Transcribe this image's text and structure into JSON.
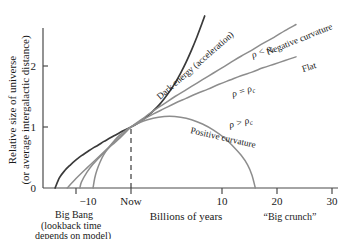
{
  "chart_data": {
    "type": "line",
    "title": "",
    "xlabel": "Billions of years",
    "ylabel": "Relative size of universe (or average intergalactic distance)",
    "ylabel_line1": "Relative size of universe",
    "ylabel_line2": "(or average intergalactic distance)",
    "xlim": [
      -14,
      30
    ],
    "ylim": [
      0,
      2.75
    ],
    "grid": false,
    "legend": "inline-curve-labels",
    "x_ticks": [
      {
        "value": -10,
        "label": "−10"
      },
      {
        "value": 0,
        "label": "Now"
      },
      {
        "value": 10,
        "label": "10"
      },
      {
        "value": 20,
        "label": "20"
      },
      {
        "value": 30,
        "label": "30"
      }
    ],
    "y_ticks": [
      {
        "value": 0,
        "label": "0"
      },
      {
        "value": 1,
        "label": "1"
      },
      {
        "value": 2,
        "label": "2"
      }
    ],
    "reference_lines": [
      {
        "name": "now-dashed-line",
        "x": 0,
        "y_from": 0,
        "y_to": 1,
        "style": "dashed"
      }
    ],
    "series": [
      {
        "name": "dark-energy",
        "label": "Dark energy (acceleration)",
        "color": "#3a3a3a",
        "width": 1.7,
        "big_bang_x": -13.8,
        "points": [
          [
            -13.8,
            0.0
          ],
          [
            -13.0,
            0.17
          ],
          [
            -12.0,
            0.29
          ],
          [
            -11.0,
            0.38
          ],
          [
            -10.0,
            0.46
          ],
          [
            -9.0,
            0.53
          ],
          [
            -8.0,
            0.59
          ],
          [
            -7.0,
            0.65
          ],
          [
            -6.0,
            0.7
          ],
          [
            -5.0,
            0.76
          ],
          [
            -4.0,
            0.81
          ],
          [
            -3.0,
            0.86
          ],
          [
            -2.0,
            0.91
          ],
          [
            -1.0,
            0.955
          ],
          [
            0.0,
            1.0
          ],
          [
            1.0,
            1.05
          ],
          [
            2.0,
            1.11
          ],
          [
            3.0,
            1.18
          ],
          [
            4.0,
            1.26
          ],
          [
            5.0,
            1.35
          ],
          [
            6.0,
            1.46
          ],
          [
            7.0,
            1.58
          ],
          [
            8.0,
            1.72
          ],
          [
            9.0,
            1.88
          ],
          [
            10.0,
            2.06
          ],
          [
            11.0,
            2.26
          ],
          [
            12.0,
            2.48
          ],
          [
            13.0,
            2.72
          ],
          [
            13.4,
            2.82
          ]
        ]
      },
      {
        "name": "negative-curvature",
        "label": "Negative curvature",
        "rho_label": "ρ < ρc",
        "color": "#8d8d8d",
        "width": 1.5,
        "big_bang_x": -11.6,
        "points": [
          [
            -11.6,
            0.0
          ],
          [
            -10.0,
            0.155
          ],
          [
            -8.0,
            0.33
          ],
          [
            -6.0,
            0.5
          ],
          [
            -4.0,
            0.67
          ],
          [
            -2.0,
            0.84
          ],
          [
            0.0,
            1.0
          ],
          [
            2.0,
            1.13
          ],
          [
            4.0,
            1.26
          ],
          [
            6.0,
            1.38
          ],
          [
            8.0,
            1.5
          ],
          [
            10.0,
            1.61
          ],
          [
            12.0,
            1.72
          ],
          [
            14.0,
            1.83
          ],
          [
            16.0,
            1.94
          ],
          [
            18.0,
            2.05
          ],
          [
            20.0,
            2.16
          ],
          [
            22.0,
            2.26
          ],
          [
            24.0,
            2.37
          ],
          [
            26.0,
            2.47
          ],
          [
            28.0,
            2.58
          ],
          [
            30.0,
            2.68
          ]
        ]
      },
      {
        "name": "flat",
        "label": "Flat",
        "rho_label": "ρ = ρc",
        "color": "#8d8d8d",
        "width": 1.5,
        "big_bang_x": -9.3,
        "points": [
          [
            -9.3,
            0.0
          ],
          [
            -9.0,
            0.1
          ],
          [
            -8.0,
            0.26
          ],
          [
            -7.0,
            0.38
          ],
          [
            -6.0,
            0.48
          ],
          [
            -5.0,
            0.57
          ],
          [
            -4.0,
            0.66
          ],
          [
            -3.0,
            0.74
          ],
          [
            -2.0,
            0.82
          ],
          [
            -1.0,
            0.91
          ],
          [
            0.0,
            1.0
          ],
          [
            2.0,
            1.11
          ],
          [
            4.0,
            1.21
          ],
          [
            6.0,
            1.3
          ],
          [
            8.0,
            1.39
          ],
          [
            10.0,
            1.47
          ],
          [
            12.0,
            1.55
          ],
          [
            14.0,
            1.62
          ],
          [
            16.0,
            1.7
          ],
          [
            18.0,
            1.77
          ],
          [
            20.0,
            1.84
          ],
          [
            22.0,
            1.9
          ],
          [
            24.0,
            1.97
          ],
          [
            26.0,
            2.03
          ],
          [
            28.0,
            2.09
          ],
          [
            30.0,
            2.15
          ]
        ]
      },
      {
        "name": "positive-curvature",
        "label": "Positive curvature",
        "rho_label": "ρ > ρc",
        "color": "#8d8d8d",
        "width": 1.5,
        "big_bang_x": -6.9,
        "big_crunch_x": 22.6,
        "points": [
          [
            -6.9,
            0.0
          ],
          [
            -6.6,
            0.16
          ],
          [
            -6.2,
            0.29
          ],
          [
            -5.6,
            0.43
          ],
          [
            -5.0,
            0.54
          ],
          [
            -4.0,
            0.67
          ],
          [
            -3.0,
            0.78
          ],
          [
            -2.0,
            0.87
          ],
          [
            -1.0,
            0.94
          ],
          [
            0.0,
            1.0
          ],
          [
            1.5,
            1.07
          ],
          [
            3.0,
            1.12
          ],
          [
            5.0,
            1.16
          ],
          [
            7.0,
            1.175
          ],
          [
            9.0,
            1.16
          ],
          [
            11.0,
            1.12
          ],
          [
            13.0,
            1.05
          ],
          [
            15.0,
            0.95
          ],
          [
            17.0,
            0.82
          ],
          [
            18.5,
            0.69
          ],
          [
            20.0,
            0.54
          ],
          [
            21.2,
            0.38
          ],
          [
            22.0,
            0.21
          ],
          [
            22.6,
            0.0
          ]
        ]
      }
    ],
    "annotations": [
      {
        "name": "big-bang-note",
        "lines": [
          "Big Bang",
          "(lookback time",
          "depends on model)"
        ]
      },
      {
        "name": "big-crunch-note",
        "text": "“Big crunch”"
      }
    ]
  }
}
